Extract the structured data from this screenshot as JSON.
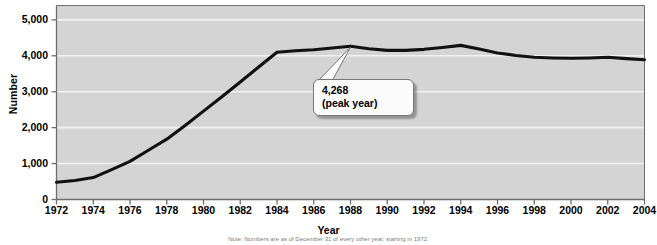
{
  "chart_data": {
    "type": "line",
    "title": "",
    "xlabel": "Year",
    "ylabel": "Number",
    "xlim": [
      1972,
      2004
    ],
    "ylim": [
      0,
      5400
    ],
    "grid": true,
    "legend": false,
    "y_ticks": [
      0,
      1000,
      2000,
      3000,
      4000,
      5000
    ],
    "y_tick_labels": [
      "0",
      "1,000",
      "2,000",
      "3,000",
      "4,000",
      "5,000"
    ],
    "x_ticks": [
      1972,
      1974,
      1976,
      1978,
      1980,
      1982,
      1984,
      1986,
      1988,
      1990,
      1992,
      1994,
      1996,
      1998,
      2000,
      2002,
      2004
    ],
    "x_tick_labels": [
      "1972",
      "1974",
      "1976",
      "1978",
      "1980",
      "1982",
      "1984",
      "1986",
      "1988",
      "1990",
      "1992",
      "1994",
      "1996",
      "1998",
      "2000",
      "2002",
      "2004"
    ],
    "series": [
      {
        "name": "Number",
        "color": "#111111",
        "x": [
          1972,
          1973,
          1974,
          1975,
          1976,
          1977,
          1978,
          1979,
          1980,
          1981,
          1982,
          1983,
          1984,
          1985,
          1986,
          1987,
          1988,
          1989,
          1990,
          1991,
          1992,
          1993,
          1994,
          1995,
          1996,
          1997,
          1998,
          1999,
          2000,
          2001,
          2002,
          2003,
          2004
        ],
        "values": [
          480,
          530,
          610,
          830,
          1060,
          1370,
          1680,
          2060,
          2460,
          2860,
          3270,
          3690,
          4100,
          4140,
          4170,
          4215,
          4268,
          4195,
          4150,
          4150,
          4180,
          4230,
          4290,
          4190,
          4080,
          4010,
          3960,
          3940,
          3930,
          3940,
          3960,
          3920,
          3890
        ]
      }
    ],
    "annotations": [
      {
        "name": "peak-callout",
        "value_label": "4,268",
        "sub_label": "(peak year)",
        "at_x": 1988,
        "at_y": 4268
      }
    ],
    "style": {
      "plot_background": "#d4d4d4",
      "gridline_color": "#f2f2f2",
      "axis_color": "#6e6e6e",
      "line_color": "#111111",
      "page_background": "#ffffff"
    }
  },
  "footnote": {
    "text": "Note: Numbers are as of December 31 of every other year, starting in 1972."
  }
}
